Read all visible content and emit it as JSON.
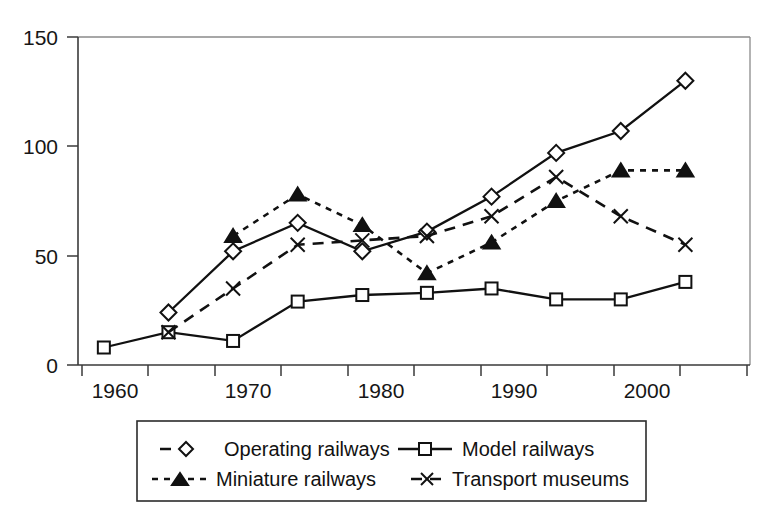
{
  "chart_data": {
    "type": "line",
    "title": "",
    "subtitle": "",
    "xlabel": "",
    "ylabel": "",
    "x": [
      1960,
      1965,
      1970,
      1975,
      1980,
      1985,
      1990,
      1995,
      2000,
      2005
    ],
    "xlim": [
      1958,
      2010
    ],
    "ylim": [
      0,
      150
    ],
    "xticks": [
      1960,
      1965,
      1970,
      1975,
      1980,
      1985,
      1990,
      1995,
      2000,
      2005,
      2010
    ],
    "xticklabels": [
      "1960",
      "",
      "1970",
      "",
      "1980",
      "",
      "1990",
      "",
      "2000",
      "",
      ""
    ],
    "yticks": [
      0,
      50,
      100,
      150
    ],
    "yticklabels": [
      "0",
      "50",
      "100",
      "150"
    ],
    "grid": false,
    "legend_position": "bottom",
    "series": [
      {
        "name": "Operating railways",
        "marker": "diamond",
        "marker_fill": "open",
        "linestyle": "solid",
        "x": [
          1965,
          1970,
          1975,
          1980,
          1985,
          1990,
          1995,
          2000,
          2005
        ],
        "values": [
          24,
          52,
          65,
          52,
          61,
          77,
          97,
          107,
          130
        ]
      },
      {
        "name": "Model railways",
        "marker": "square",
        "marker_fill": "open",
        "linestyle": "solid",
        "x": [
          1960,
          1965,
          1970,
          1975,
          1980,
          1985,
          1990,
          1995,
          2000,
          2005
        ],
        "values": [
          8,
          15,
          11,
          29,
          32,
          33,
          35,
          30,
          30,
          38
        ]
      },
      {
        "name": "Miniature railways",
        "marker": "triangle",
        "marker_fill": "filled",
        "linestyle": "dotted",
        "x": [
          1970,
          1975,
          1980,
          1985,
          1990,
          1995,
          2000,
          2005
        ],
        "values": [
          59,
          78,
          64,
          42,
          56,
          75,
          89,
          89
        ]
      },
      {
        "name": "Transport museums",
        "marker": "cross",
        "marker_fill": "none",
        "linestyle": "dashed",
        "x": [
          1965,
          1970,
          1975,
          1980,
          1985,
          1990,
          1995,
          2000,
          2005
        ],
        "values": [
          15,
          35,
          55,
          57,
          59,
          68,
          86,
          68,
          55
        ]
      }
    ]
  },
  "legend": {
    "entries": [
      {
        "label": "Operating railways",
        "marker": "diamond-open-icon",
        "linestyle": "dashed"
      },
      {
        "label": "Model railways",
        "marker": "square-open-icon",
        "linestyle": "solid"
      },
      {
        "label": "Miniature railways",
        "marker": "triangle-filled-icon",
        "linestyle": "dotted"
      },
      {
        "label": "Transport museums",
        "marker": "cross-icon",
        "linestyle": "dashed"
      }
    ]
  },
  "axes": {
    "y_tick_labels": [
      "150",
      "100",
      "50",
      "0"
    ],
    "x_tick_labels": [
      "1960",
      "1970",
      "1980",
      "1990",
      "2000"
    ]
  }
}
